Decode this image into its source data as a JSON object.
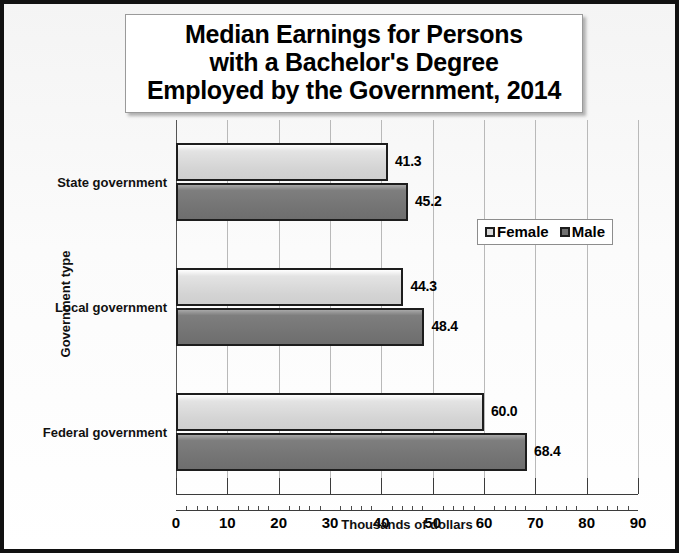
{
  "title": {
    "lines": [
      "Median Earnings for Persons",
      "with a Bachelor's Degree",
      "Employed by the Government, 2014"
    ]
  },
  "legend": {
    "position": "middle-right-inside",
    "items": [
      {
        "label": "Female",
        "color": "#d8d8d8",
        "marker": "square-legend-icon"
      },
      {
        "label": "Male",
        "color": "#6f6f6f",
        "marker": "square-legend-icon"
      }
    ]
  },
  "axes": {
    "x": {
      "title": "Thousands of dollars",
      "ticks": [
        "0",
        "10",
        "20",
        "30",
        "40",
        "50",
        "60",
        "70",
        "80",
        "90"
      ],
      "min": 0,
      "max": 90,
      "major_step": 10,
      "minor_step": 2
    },
    "y": {
      "title": "Government type",
      "categories": [
        "State government",
        "Local government",
        "Federal government"
      ]
    }
  },
  "chart_data": {
    "type": "bar",
    "orientation": "horizontal",
    "title": "Median Earnings for Persons with a Bachelor's Degree Employed by the Government, 2014",
    "xlabel": "Thousands of dollars",
    "ylabel": "Government type",
    "xlim": [
      0,
      90
    ],
    "grid": true,
    "legend_position": "middle right (inside plot)",
    "categories": [
      "State government",
      "Local government",
      "Federal government"
    ],
    "series": [
      {
        "name": "Female",
        "color": "#d8d8d8",
        "values": [
          41.3,
          44.3,
          60.0
        ],
        "labels": [
          "41.3",
          "44.3",
          "60.0"
        ]
      },
      {
        "name": "Male",
        "color": "#6f6f6f",
        "values": [
          45.2,
          48.4,
          68.4
        ],
        "labels": [
          "45.2",
          "48.4",
          "68.4"
        ]
      }
    ]
  }
}
